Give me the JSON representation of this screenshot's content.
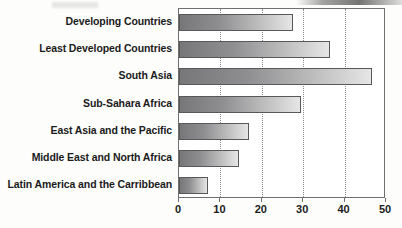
{
  "chart_data": {
    "type": "bar",
    "orientation": "horizontal",
    "title": "",
    "subtitle": "",
    "xlabel": "",
    "ylabel": "",
    "xlim": [
      0,
      50
    ],
    "grid": true,
    "legend": false,
    "legend_position": "none",
    "xticks": [
      "0",
      "10",
      "20",
      "30",
      "40",
      "50"
    ],
    "xtick_values": [
      0,
      10,
      20,
      30,
      40,
      50
    ],
    "categories": [
      "Developing Countries",
      "Least Developed Countries",
      "South Asia",
      "Sub-Sahara Africa",
      "East Asia and the Pacific",
      "Middle East and North Africa",
      "Latin America and the Carribbean"
    ],
    "values": [
      27.5,
      36.5,
      46.5,
      29.5,
      17,
      14.5,
      7
    ],
    "series": [
      {
        "name": "",
        "values": [
          27.5,
          36.5,
          46.5,
          29.5,
          17,
          14.5,
          7
        ]
      }
    ]
  },
  "style": {
    "bar_fill_dark": "#77777a",
    "bar_fill_light": "#e6e6e6",
    "bar_border": "#58585a",
    "gridline_color": "#8a8a8a",
    "frame_color": "#6f6f6f",
    "text_color": "#1b1b1b",
    "background": "#ffffff"
  }
}
